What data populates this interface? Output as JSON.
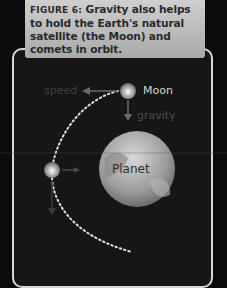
{
  "figure": {
    "label": "FIGURE 6:",
    "caption": " Gravity also helps to hold the Earth's natural satellite (the Moon) and comets in orbit."
  },
  "diagram": {
    "planet_label": "Planet",
    "moon_label": "Moon",
    "speed_label": "speed",
    "gravity_label": "gravity"
  },
  "colors": {
    "frame": "#d8d8d8",
    "caption_bg": "#bdbdbd",
    "background": "#161616",
    "orbit_path": "#e0e0e0"
  }
}
